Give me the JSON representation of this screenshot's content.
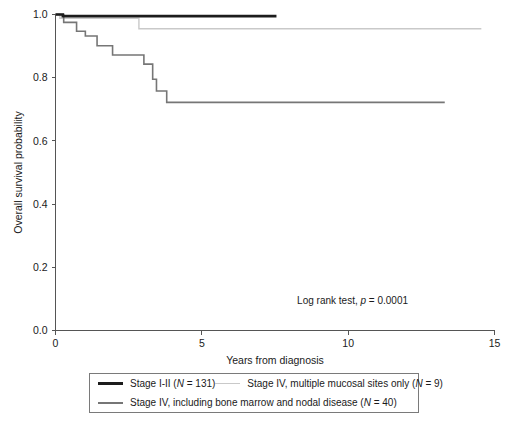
{
  "chart_data": {
    "type": "line",
    "title": "",
    "xlabel": "Years from diagnosis",
    "ylabel": "Overall survival probability",
    "xlim": [
      0,
      15
    ],
    "ylim": [
      0.0,
      1.0
    ],
    "xticks": [
      "0",
      "5",
      "10",
      "15"
    ],
    "xtick_values": [
      0,
      5,
      10,
      15
    ],
    "yticks": [
      "0.0",
      "0.2",
      "0.4",
      "0.6",
      "0.8",
      "1.0"
    ],
    "ytick_values": [
      0.0,
      0.2,
      0.4,
      0.6,
      0.8,
      1.0
    ],
    "grid": false,
    "legend_position": "below-axes",
    "annotation": {
      "prefix": "Log rank test, ",
      "italic": "p",
      "suffix": " = 0.0001",
      "x": 10.15,
      "y": 0.085
    },
    "series": [
      {
        "name": "Stage I-II (N = 131)",
        "label_prefix": "Stage I-II (",
        "label_italic": "N",
        "label_suffix": " = 131)",
        "n": 131,
        "color": "#1c1c1c",
        "width": 2.6,
        "points": [
          [
            0.0,
            1.0
          ],
          [
            0.25,
            1.0
          ],
          [
            0.25,
            0.995
          ],
          [
            7.55,
            0.995
          ]
        ]
      },
      {
        "name": "Stage IV, multiple mucosal sites only (N = 9)",
        "label_prefix": "Stage IV, multiple mucosal sites only (",
        "label_italic": "N",
        "label_suffix": " = 9)",
        "n": 9,
        "color": "#c9c9c9",
        "width": 1.4,
        "points": [
          [
            0.0,
            1.0
          ],
          [
            0.15,
            1.0
          ],
          [
            0.15,
            0.988
          ],
          [
            2.85,
            0.988
          ],
          [
            2.85,
            0.955
          ],
          [
            14.55,
            0.955
          ]
        ]
      },
      {
        "name": "Stage IV, including bone marrow and nodal disease (N = 40)",
        "label_prefix": "Stage IV, including bone marrow and nodal disease (",
        "label_italic": "N",
        "label_suffix": " = 40)",
        "n": 40,
        "color": "#767676",
        "width": 1.6,
        "points": [
          [
            0.0,
            1.0
          ],
          [
            0.28,
            1.0
          ],
          [
            0.28,
            0.975
          ],
          [
            0.72,
            0.975
          ],
          [
            0.72,
            0.947
          ],
          [
            1.02,
            0.947
          ],
          [
            1.02,
            0.932
          ],
          [
            1.42,
            0.932
          ],
          [
            1.42,
            0.901
          ],
          [
            1.95,
            0.901
          ],
          [
            1.95,
            0.872
          ],
          [
            3.02,
            0.872
          ],
          [
            3.02,
            0.843
          ],
          [
            3.32,
            0.843
          ],
          [
            3.32,
            0.795
          ],
          [
            3.45,
            0.795
          ],
          [
            3.45,
            0.758
          ],
          [
            3.8,
            0.758
          ],
          [
            3.8,
            0.722
          ],
          [
            13.3,
            0.722
          ]
        ]
      }
    ]
  },
  "legend": {
    "rows": [
      [
        "series0",
        "series1"
      ],
      [
        "series2"
      ]
    ]
  }
}
